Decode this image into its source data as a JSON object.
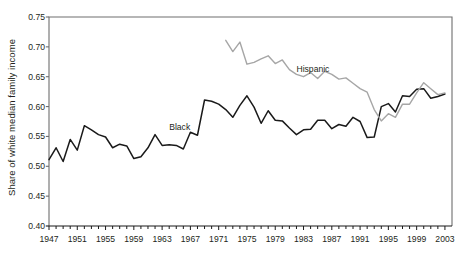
{
  "chart_data": {
    "type": "line",
    "title": "",
    "subtitle": "",
    "xlabel": "",
    "ylabel": "Share of white median family income",
    "xlim": [
      1947,
      2004
    ],
    "ylim": [
      0.4,
      0.75
    ],
    "yticks": [
      "0.40",
      "0.45",
      "0.50",
      "0.55",
      "0.60",
      "0.65",
      "0.70",
      "0.75"
    ],
    "ytick_values": [
      0.4,
      0.45,
      0.5,
      0.55,
      0.6,
      0.65,
      0.7,
      0.75
    ],
    "xticks": [
      "1947",
      "1951",
      "1955",
      "1959",
      "1963",
      "1967",
      "1971",
      "1975",
      "1979",
      "1983",
      "1987",
      "1991",
      "1995",
      "1999",
      "2003"
    ],
    "xtick_values": [
      1947,
      1951,
      1955,
      1959,
      1963,
      1967,
      1971,
      1975,
      1979,
      1983,
      1987,
      1991,
      1995,
      1999,
      2003
    ],
    "minor_xtick_interval": 1,
    "grid": false,
    "legend_position": "inline-annotation",
    "annotations": [
      {
        "text": "Black",
        "x": 1964,
        "y": 0.575
      },
      {
        "text": "Hispanic",
        "x": 1982,
        "y": 0.672
      }
    ],
    "series": [
      {
        "name": "Black",
        "color": "#1a1a1a",
        "width": 1.5,
        "x": [
          1947,
          1948,
          1949,
          1950,
          1951,
          1952,
          1953,
          1954,
          1955,
          1956,
          1957,
          1958,
          1959,
          1960,
          1961,
          1962,
          1963,
          1964,
          1965,
          1966,
          1967,
          1968,
          1969,
          1970,
          1971,
          1972,
          1973,
          1974,
          1975,
          1976,
          1977,
          1978,
          1979,
          1980,
          1981,
          1982,
          1983,
          1984,
          1985,
          1986,
          1987,
          1988,
          1989,
          1990,
          1991,
          1992,
          1993,
          1994,
          1995,
          1996,
          1997,
          1998,
          1999,
          2000,
          2001,
          2002,
          2003
        ],
        "values": [
          0.511,
          0.531,
          0.508,
          0.545,
          0.527,
          0.568,
          0.561,
          0.553,
          0.549,
          0.531,
          0.537,
          0.534,
          0.513,
          0.516,
          0.531,
          0.553,
          0.535,
          0.536,
          0.535,
          0.529,
          0.557,
          0.552,
          0.611,
          0.609,
          0.604,
          0.595,
          0.582,
          0.602,
          0.618,
          0.599,
          0.572,
          0.593,
          0.577,
          0.576,
          0.564,
          0.553,
          0.561,
          0.562,
          0.577,
          0.577,
          0.563,
          0.57,
          0.567,
          0.582,
          0.575,
          0.548,
          0.549,
          0.6,
          0.605,
          0.591,
          0.618,
          0.617,
          0.629,
          0.63,
          0.614,
          0.617,
          0.621
        ]
      },
      {
        "name": "Hispanic",
        "color": "#a6a6a6",
        "width": 1.4,
        "x": [
          1972,
          1973,
          1974,
          1975,
          1976,
          1977,
          1978,
          1979,
          1980,
          1981,
          1982,
          1983,
          1984,
          1985,
          1986,
          1987,
          1988,
          1989,
          1990,
          1991,
          1992,
          1993,
          1994,
          1995,
          1996,
          1997,
          1998,
          1999,
          2000,
          2001,
          2002,
          2003
        ],
        "values": [
          0.711,
          0.692,
          0.708,
          0.671,
          0.674,
          0.68,
          0.685,
          0.672,
          0.678,
          0.662,
          0.654,
          0.65,
          0.657,
          0.647,
          0.659,
          0.654,
          0.646,
          0.648,
          0.639,
          0.63,
          0.624,
          0.595,
          0.576,
          0.588,
          0.582,
          0.604,
          0.604,
          0.623,
          0.64,
          0.63,
          0.62,
          0.623
        ]
      }
    ]
  },
  "plot": {
    "frame_color": "#6e6e6e",
    "background": "#ffffff"
  }
}
